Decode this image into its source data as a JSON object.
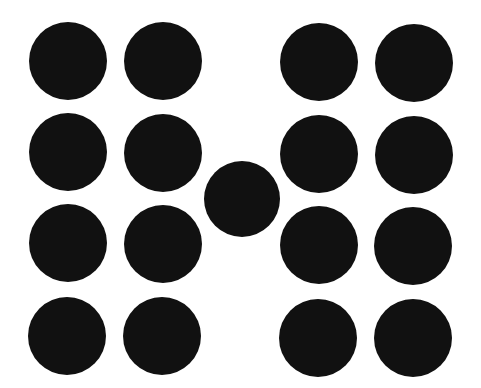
{
  "figure": {
    "background": "#ffffff",
    "dot_color": "#111111",
    "dots": [
      {
        "id": "r1c1",
        "cx": 68,
        "cy": 61,
        "r": 39
      },
      {
        "id": "r1c2",
        "cx": 163,
        "cy": 61,
        "r": 39
      },
      {
        "id": "r1c3",
        "cx": 319,
        "cy": 62,
        "r": 39
      },
      {
        "id": "r1c4",
        "cx": 414,
        "cy": 63,
        "r": 39
      },
      {
        "id": "r2c1",
        "cx": 68,
        "cy": 152,
        "r": 39
      },
      {
        "id": "r2c2",
        "cx": 163,
        "cy": 153,
        "r": 39
      },
      {
        "id": "r2c3",
        "cx": 319,
        "cy": 154,
        "r": 39
      },
      {
        "id": "r2c4",
        "cx": 414,
        "cy": 155,
        "r": 39
      },
      {
        "id": "center",
        "cx": 242,
        "cy": 199,
        "r": 38
      },
      {
        "id": "r3c1",
        "cx": 68,
        "cy": 243,
        "r": 39
      },
      {
        "id": "r3c2",
        "cx": 163,
        "cy": 244,
        "r": 39
      },
      {
        "id": "r3c3",
        "cx": 319,
        "cy": 245,
        "r": 39
      },
      {
        "id": "r3c4",
        "cx": 413,
        "cy": 246,
        "r": 39
      },
      {
        "id": "r4c1",
        "cx": 67,
        "cy": 336,
        "r": 39
      },
      {
        "id": "r4c2",
        "cx": 162,
        "cy": 336,
        "r": 39
      },
      {
        "id": "r4c3",
        "cx": 318,
        "cy": 338,
        "r": 39
      },
      {
        "id": "r4c4",
        "cx": 413,
        "cy": 338,
        "r": 39
      }
    ]
  }
}
